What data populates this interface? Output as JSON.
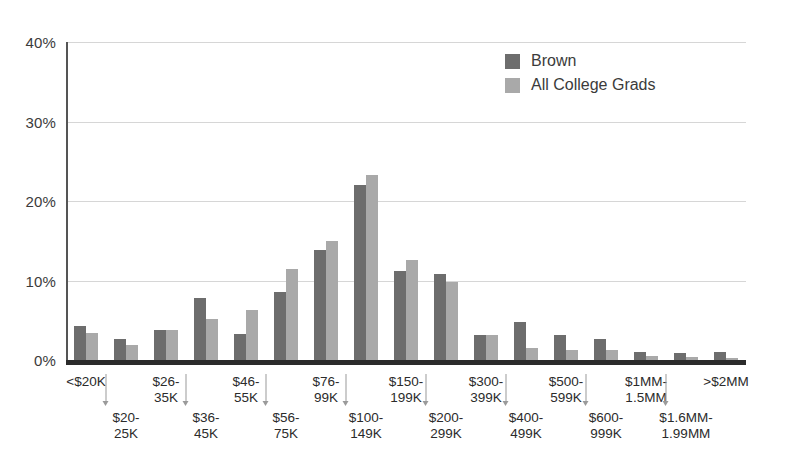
{
  "chart_data": {
    "type": "bar",
    "title": "",
    "xlabel": "",
    "ylabel": "",
    "ylim": [
      0,
      40
    ],
    "y_ticks": [
      "0%",
      "10%",
      "20%",
      "30%",
      "40%"
    ],
    "y_tick_values": [
      0,
      10,
      20,
      30,
      40
    ],
    "grid": true,
    "legend_position": "top-right",
    "categories": [
      "<$20K",
      "$20-\n25K",
      "$26-\n35K",
      "$36-\n45K",
      "$46-\n55K",
      "$56-\n75K",
      "$76-\n99K",
      "$100-\n149K",
      "$150-\n199K",
      "$200-\n299K",
      "$300-\n399K",
      "$400-\n499K",
      "$500-\n599K",
      "$600-\n999K",
      "$1MM-\n1.5MM",
      "$1.6MM-\n1.99MM",
      ">$2MM"
    ],
    "series": [
      {
        "name": "Brown",
        "color": "#6d6d6d",
        "values": [
          4.3,
          2.7,
          3.8,
          7.8,
          3.3,
          8.5,
          13.9,
          22.0,
          11.2,
          10.8,
          3.2,
          4.8,
          3.2,
          2.7,
          1.0,
          0.9,
          1.0
        ]
      },
      {
        "name": "All College Grads",
        "color": "#a9a9a9",
        "values": [
          3.4,
          1.9,
          3.8,
          5.2,
          6.3,
          11.5,
          15.0,
          23.3,
          12.6,
          9.8,
          3.2,
          1.5,
          1.2,
          1.3,
          0.5,
          0.4,
          0.3
        ]
      }
    ]
  },
  "x_axis_labels": [
    {
      "text": "<$20K",
      "row": "top"
    },
    {
      "text": "$20-\n25K",
      "row": "bottom"
    },
    {
      "text": "$26-\n35K",
      "row": "top"
    },
    {
      "text": "$36-\n45K",
      "row": "bottom"
    },
    {
      "text": "$46-\n55K",
      "row": "top"
    },
    {
      "text": "$56-\n75K",
      "row": "bottom"
    },
    {
      "text": "$76-\n99K",
      "row": "top"
    },
    {
      "text": "$100-\n149K",
      "row": "bottom"
    },
    {
      "text": "$150-\n199K",
      "row": "top"
    },
    {
      "text": "$200-\n299K",
      "row": "bottom"
    },
    {
      "text": "$300-\n399K",
      "row": "top"
    },
    {
      "text": "$400-\n499K",
      "row": "bottom"
    },
    {
      "text": "$500-\n599K",
      "row": "top"
    },
    {
      "text": "$600-\n999K",
      "row": "bottom"
    },
    {
      "text": "$1MM-\n1.5MM",
      "row": "top"
    },
    {
      "text": "$1.6MM-\n1.99MM",
      "row": "bottom"
    },
    {
      "text": ">$2MM",
      "row": "top"
    }
  ],
  "legend": {
    "items": [
      {
        "label": "Brown",
        "swatch": "brown"
      },
      {
        "label": "All College Grads",
        "swatch": "allgrads"
      }
    ]
  },
  "colors": {
    "brown": "#6d6d6d",
    "all_college_grads": "#a9a9a9",
    "gridline": "#d6d6d6",
    "axis": "#2b2b2b",
    "text": "#3b3b3b",
    "background": "#ffffff"
  }
}
